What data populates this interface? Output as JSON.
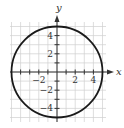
{
  "chart_data": {
    "type": "line",
    "title": "",
    "xlabel": "x",
    "ylabel": "y",
    "xlim": [
      -5,
      5
    ],
    "ylim": [
      -5,
      5
    ],
    "grid": true,
    "legend": null,
    "x_tick_labels": [
      "-2",
      "2",
      "4"
    ],
    "y_tick_labels": [
      "4",
      "2",
      "-2",
      "-4"
    ],
    "series": [
      {
        "name": "circle",
        "shape": "circle",
        "center": [
          0,
          0
        ],
        "radius": 5,
        "equation": "x^2 + y^2 = 25"
      }
    ],
    "annotations": []
  },
  "axes": {
    "x_label": "x",
    "y_label": "y",
    "x_ticks": [
      {
        "value": -2,
        "label": "−2"
      },
      {
        "value": 2,
        "label": "2"
      },
      {
        "value": 4,
        "label": "4"
      }
    ],
    "y_ticks": [
      {
        "value": 4,
        "label": "4"
      },
      {
        "value": 2,
        "label": "2"
      },
      {
        "value": -2,
        "label": "−2"
      },
      {
        "value": -4,
        "label": "−4"
      }
    ]
  },
  "colors": {
    "grid": "#d0d0d0",
    "axis": "#333333",
    "curve": "#1a1a1a"
  }
}
